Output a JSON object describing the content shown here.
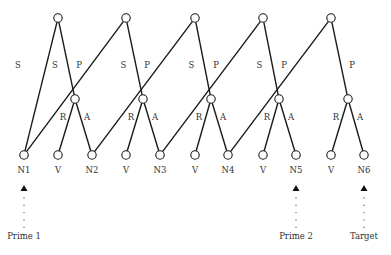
{
  "diagram": {
    "trees": [
      {
        "root": {
          "x": 58,
          "y": 18
        },
        "mid": {
          "x": 75,
          "y": 99
        },
        "left_leaf": 0,
        "v_leaf": 1,
        "right_leaf": 2,
        "labels": {
          "s": "S",
          "p": "P",
          "r": "R",
          "a": "A"
        }
      },
      {
        "root": {
          "x": 126,
          "y": 18
        },
        "mid": {
          "x": 143,
          "y": 99
        },
        "left_leaf": 0,
        "v_leaf": 3,
        "right_leaf": 4,
        "labels": {
          "s": "S",
          "p": "P",
          "r": "R",
          "a": "A"
        }
      },
      {
        "root": {
          "x": 195,
          "y": 18
        },
        "mid": {
          "x": 211,
          "y": 99
        },
        "left_leaf": 2,
        "v_leaf": 5,
        "right_leaf": 6,
        "labels": {
          "s": "S",
          "p": "P",
          "r": "R",
          "a": "A"
        }
      },
      {
        "root": {
          "x": 263,
          "y": 18
        },
        "mid": {
          "x": 279,
          "y": 99
        },
        "left_leaf": 4,
        "v_leaf": 7,
        "right_leaf": 8,
        "labels": {
          "s": "S",
          "p": "P",
          "r": "R",
          "a": "A"
        }
      },
      {
        "root": {
          "x": 331,
          "y": 18
        },
        "mid": {
          "x": 348,
          "y": 99
        },
        "left_leaf": 6,
        "v_leaf": 9,
        "right_leaf": 10,
        "labels": {
          "s": "S",
          "p": "P",
          "r": "R",
          "a": "A"
        }
      }
    ],
    "leaves": [
      {
        "x": 24,
        "label": "N1"
      },
      {
        "x": 58,
        "label": "V"
      },
      {
        "x": 92,
        "label": "N2"
      },
      {
        "x": 126,
        "label": "V"
      },
      {
        "x": 160,
        "label": "N3"
      },
      {
        "x": 195,
        "label": "V"
      },
      {
        "x": 228,
        "label": "N4"
      },
      {
        "x": 263,
        "label": "V"
      },
      {
        "x": 296,
        "label": "N5"
      },
      {
        "x": 331,
        "label": "V"
      },
      {
        "x": 364,
        "label": "N6"
      }
    ],
    "leaf_y": 155,
    "pointers": [
      {
        "x": 24,
        "label": "Prime 1"
      },
      {
        "x": 296,
        "label": "Prime 2"
      },
      {
        "x": 364,
        "label": "Target"
      }
    ]
  }
}
